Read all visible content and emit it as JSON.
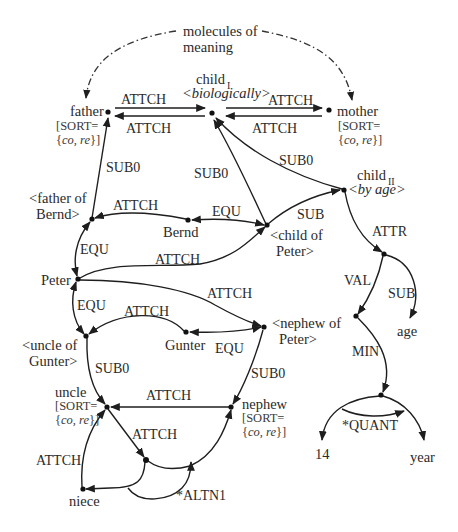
{
  "diagram": {
    "type": "semantic network (MultiNet-style)",
    "annotation": {
      "line1": "molecules of",
      "line2": "meaning"
    },
    "nodes": {
      "father": {
        "label": "father",
        "sort1": "[SORT=",
        "sort2_open": "{",
        "sort2_items": "co, re",
        "sort2_close": "}]"
      },
      "mother": {
        "label": "mother",
        "sort1": "[SORT=",
        "sort2_open": "{",
        "sort2_items": "co, re",
        "sort2_close": "}]"
      },
      "child1": {
        "label": "child",
        "subscript": "I",
        "gloss": "<biologically>"
      },
      "child2": {
        "label": "child",
        "subscript": "II",
        "gloss": "<by age>"
      },
      "father_of_bernd": {
        "line1": "<father of",
        "line2": "Bernd>"
      },
      "bernd": {
        "label": "Bernd"
      },
      "child_of_peter": {
        "line1": "<child of",
        "line2": "Peter>"
      },
      "peter": {
        "label": "Peter"
      },
      "nephew_of_peter": {
        "line1": "<nephew of",
        "line2": "Peter>"
      },
      "gunter": {
        "label": "Gunter"
      },
      "uncle_of_gunter": {
        "line1": "<uncle of",
        "line2": "Gunter>"
      },
      "uncle": {
        "label": "uncle",
        "sort1": "[SORT=",
        "sort2_items": "co, re"
      },
      "nephew": {
        "label": "nephew",
        "sort1": "[SORT=",
        "sort2_items": "co, re"
      },
      "niece": {
        "label": "niece"
      },
      "age": {
        "label": "age"
      },
      "fourteen": {
        "label": "14"
      },
      "year": {
        "label": "year"
      }
    },
    "edges": {
      "father_child1_top": "ATTCH",
      "father_child1_bottom": "ATTCH",
      "child1_mother_top": "ATTCH",
      "child1_mother_bottom": "ATTCH",
      "fob_father": "SUB0",
      "cop_child1": "SUB0",
      "child2_child1": "SUB0",
      "cop_child2": "SUB",
      "bernd_fob": "ATTCH",
      "bernd_cop": "EQU",
      "fob_peter": "EQU",
      "peter_cop": "ATTCH",
      "peter_nop": "ATTCH",
      "peter_uog": "EQU",
      "gunter_uog": "ATTCH",
      "gunter_nop": "EQU",
      "uog_uncle": "SUB0",
      "nop_nephew": "SUB0",
      "nephew_uncle": "ATTCH",
      "uncle_junction": "ATTCH",
      "niece_uncle": "ATTCH",
      "altn": "*ALTN1",
      "child2_attr": "ATTR",
      "attr_val": "VAL",
      "attr_age": "SUB",
      "val_min": "MIN",
      "quant": "*QUANT"
    }
  }
}
